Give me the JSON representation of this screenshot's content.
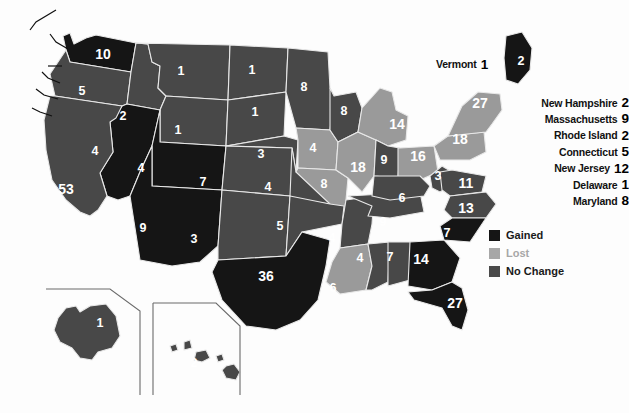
{
  "map": {
    "title": "United States Electoral Vote Apportionment Change Map",
    "background_color": "#fdfdfd",
    "border_color": "#e8e8e8",
    "label_color": "#ffffff"
  },
  "legend": {
    "items": [
      {
        "label": "Gained",
        "key": "gained",
        "color": "#151515"
      },
      {
        "label": "Lost",
        "key": "lost",
        "color": "#a7a7a7"
      },
      {
        "label": "No Change",
        "key": "nochange",
        "color": "#4a4a4a"
      }
    ]
  },
  "chart_data": {
    "type": "map",
    "value_name": "electoral_votes",
    "category_name": "change",
    "categories": [
      "gained",
      "lost",
      "nochange"
    ],
    "states": [
      {
        "code": "WA",
        "name": "Washington",
        "value": 10,
        "change": "gained",
        "lx": 103,
        "ly": 55
      },
      {
        "code": "OR",
        "name": "Oregon",
        "value": 5,
        "change": "nochange",
        "lx": 82,
        "ly": 92
      },
      {
        "code": "ID",
        "name": "Idaho",
        "value": 2,
        "change": "nochange",
        "lx": 123,
        "ly": 117
      },
      {
        "code": "MT",
        "name": "Montana",
        "value": 1,
        "change": "nochange",
        "lx": 181,
        "ly": 72
      },
      {
        "code": "WY",
        "name": "Wyoming",
        "value": 1,
        "change": "nochange",
        "lx": 178,
        "ly": 131
      },
      {
        "code": "ND",
        "name": "North Dakota",
        "value": 1,
        "change": "nochange",
        "lx": 252,
        "ly": 71
      },
      {
        "code": "SD",
        "name": "South Dakota",
        "value": 1,
        "change": "nochange",
        "lx": 255,
        "ly": 113
      },
      {
        "code": "NE",
        "name": "Nebraska",
        "value": 3,
        "change": "nochange",
        "lx": 261,
        "ly": 155
      },
      {
        "code": "KS",
        "name": "Kansas",
        "value": 4,
        "change": "nochange",
        "lx": 268,
        "ly": 188
      },
      {
        "code": "MN",
        "name": "Minnesota",
        "value": 8,
        "change": "nochange",
        "lx": 304,
        "ly": 88
      },
      {
        "code": "IA",
        "name": "Iowa",
        "value": 4,
        "change": "lost",
        "lx": 313,
        "ly": 149
      },
      {
        "code": "MO",
        "name": "Missouri",
        "value": 8,
        "change": "lost",
        "lx": 324,
        "ly": 185
      },
      {
        "code": "WI",
        "name": "Wisconsin",
        "value": 8,
        "change": "nochange",
        "lx": 344,
        "ly": 112
      },
      {
        "code": "IL",
        "name": "Illinois",
        "value": 18,
        "change": "lost",
        "lx": 358,
        "ly": 168
      },
      {
        "code": "MI",
        "name": "Michigan",
        "value": 14,
        "change": "lost",
        "lx": 397,
        "ly": 125
      },
      {
        "code": "IN",
        "name": "Indiana",
        "value": 9,
        "change": "nochange",
        "lx": 384,
        "ly": 161
      },
      {
        "code": "OH",
        "name": "Ohio",
        "value": 16,
        "change": "lost",
        "lx": 418,
        "ly": 157
      },
      {
        "code": "NV",
        "name": "Nevada",
        "value": 4,
        "change": "gained",
        "lx": 95,
        "ly": 152
      },
      {
        "code": "UT",
        "name": "Utah",
        "value": 4,
        "change": "gained",
        "lx": 141,
        "ly": 169
      },
      {
        "code": "CA",
        "name": "California",
        "value": 53,
        "change": "nochange",
        "lx": 66,
        "ly": 190
      },
      {
        "code": "CO",
        "name": "Colorado",
        "value": 7,
        "change": "nochange",
        "lx": 203,
        "ly": 183
      },
      {
        "code": "AZ",
        "name": "Arizona",
        "value": 9,
        "change": "gained",
        "lx": 143,
        "ly": 229
      },
      {
        "code": "NM",
        "name": "New Mexico",
        "value": 3,
        "change": "nochange",
        "lx": 194,
        "ly": 240
      },
      {
        "code": "OK",
        "name": "Oklahoma",
        "value": 5,
        "change": "nochange",
        "lx": 280,
        "ly": 227
      },
      {
        "code": "TX",
        "name": "Texas",
        "value": 36,
        "change": "gained",
        "lx": 266,
        "ly": 277
      },
      {
        "code": "AR",
        "name": "Arkansas",
        "value": 4,
        "change": "nochange",
        "lx": 332,
        "ly": 239
      },
      {
        "code": "LA",
        "name": "Louisiana",
        "value": 6,
        "change": "lost",
        "lx": 333,
        "ly": 289
      },
      {
        "code": "MS",
        "name": "Mississippi",
        "value": 4,
        "change": "nochange",
        "lx": 360,
        "ly": 259
      },
      {
        "code": "AL",
        "name": "Alabama",
        "value": 7,
        "change": "nochange",
        "lx": 390,
        "ly": 258
      },
      {
        "code": "TN",
        "name": "Tennessee",
        "value": 9,
        "change": "nochange",
        "lx": 383,
        "ly": 223
      },
      {
        "code": "KY",
        "name": "Kentucky",
        "value": 6,
        "change": "nochange",
        "lx": 402,
        "ly": 199
      },
      {
        "code": "WV",
        "name": "West Virginia",
        "value": 3,
        "change": "nochange",
        "lx": 438,
        "ly": 177
      },
      {
        "code": "VA",
        "name": "Virginia",
        "value": 11,
        "change": "nochange",
        "lx": 466,
        "ly": 184
      },
      {
        "code": "NC",
        "name": "North Carolina",
        "value": 13,
        "change": "nochange",
        "lx": 466,
        "ly": 209
      },
      {
        "code": "SC",
        "name": "South Carolina",
        "value": 7,
        "change": "gained",
        "lx": 447,
        "ly": 234
      },
      {
        "code": "GA",
        "name": "Georgia",
        "value": 14,
        "change": "gained",
        "lx": 421,
        "ly": 260
      },
      {
        "code": "FL",
        "name": "Florida",
        "value": 27,
        "change": "gained",
        "lx": 455,
        "ly": 304
      },
      {
        "code": "PA",
        "name": "Pennsylvania",
        "value": 18,
        "change": "lost",
        "lx": 460,
        "ly": 140
      },
      {
        "code": "NY",
        "name": "New York",
        "value": 27,
        "change": "lost",
        "lx": 480,
        "ly": 104
      },
      {
        "code": "ME",
        "name": "Maine",
        "value": 2,
        "change": "gained",
        "lx": 521,
        "ly": 62
      },
      {
        "code": "AK",
        "name": "Alaska",
        "value": 1,
        "change": "nochange",
        "lx": 100,
        "ly": 324
      },
      {
        "code": "HI",
        "name": "Hawaii",
        "value": 2,
        "change": "nochange",
        "lx": 194,
        "ly": 364
      }
    ],
    "callout_states": [
      {
        "code": "VT",
        "name": "Vermont",
        "value": 1,
        "change": "gained"
      },
      {
        "code": "NH",
        "name": "New Hampshire",
        "value": 2,
        "change": "nochange"
      },
      {
        "code": "MA",
        "name": "Massachusetts",
        "value": 9,
        "change": "lost"
      },
      {
        "code": "RI",
        "name": "Rhode Island",
        "value": 2,
        "change": "nochange"
      },
      {
        "code": "CT",
        "name": "Connecticut",
        "value": 5,
        "change": "nochange"
      },
      {
        "code": "NJ",
        "name": "New Jersey",
        "value": 12,
        "change": "nochange"
      },
      {
        "code": "DE",
        "name": "Delaware",
        "value": 1,
        "change": "nochange"
      },
      {
        "code": "MD",
        "name": "Maryland",
        "value": 8,
        "change": "nochange"
      }
    ]
  },
  "callouts": {
    "vermont": {
      "name": "Vermont",
      "value": "1"
    },
    "new_hampshire": {
      "name": "New Hampshire",
      "value": "2"
    },
    "massachusetts": {
      "name": "Massachusetts",
      "value": "9"
    },
    "rhode_island": {
      "name": "Rhode Island",
      "value": "2"
    },
    "connecticut": {
      "name": "Connecticut",
      "value": "5"
    },
    "new_jersey": {
      "name": "New Jersey",
      "value": "12"
    },
    "delaware": {
      "name": "Delaware",
      "value": "1"
    },
    "maryland": {
      "name": "Maryland",
      "value": "8"
    }
  }
}
